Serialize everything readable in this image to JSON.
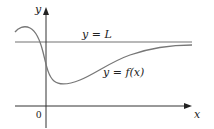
{
  "figure": {
    "axes": {
      "x_label": "x",
      "y_label": "y",
      "origin_label": "0"
    },
    "asymptote": {
      "label": "y = L",
      "color": "#9a9a9a"
    },
    "curve": {
      "label": "y = f(x)",
      "color": "#7a7a7a"
    },
    "axis_color": "#333333"
  }
}
